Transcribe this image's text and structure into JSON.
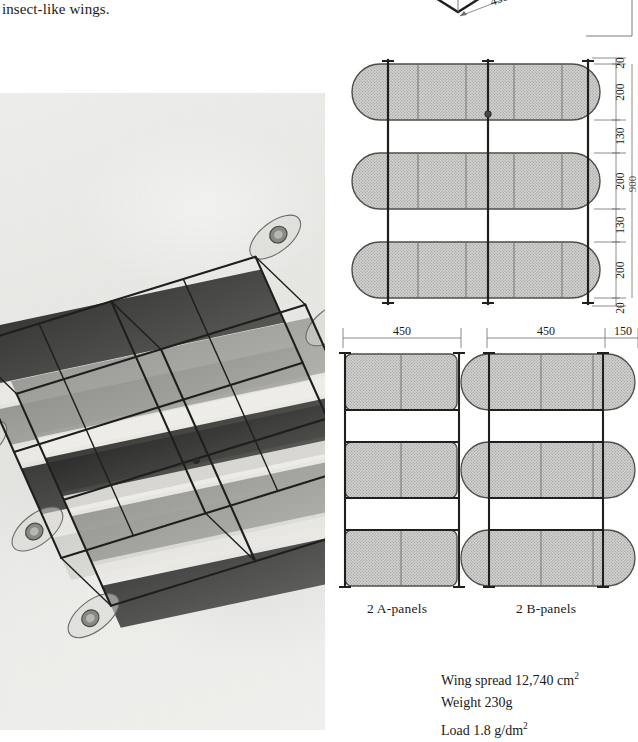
{
  "page": {
    "body_text": "insect-like wings."
  },
  "photo": {
    "alt_name": "box-kite-in-flight-photograph",
    "subject": "multi-cell box kite with insect-like wings flying against a cloudy sky",
    "tone": "black-and-white"
  },
  "top_diagram": {
    "label_left": "B",
    "label_right": "B",
    "dimension": "450"
  },
  "plan_view": {
    "name": "kite-plan-view",
    "vertical_dimensions": [
      "20",
      "200",
      "130",
      "200",
      "130",
      "200",
      "20"
    ],
    "overall_dimension": "900",
    "cell_count": 3
  },
  "panel_views": {
    "a_panel": {
      "caption": "2 A-panels",
      "dimensions": [
        "450"
      ]
    },
    "b_panel": {
      "caption": "2 B-panels",
      "dimensions": [
        "450",
        "150"
      ]
    }
  },
  "specs": {
    "wing_spread": "Wing spread 12,740 cm",
    "wing_spread_sup": "2",
    "weight": "Weight 230g",
    "load": "Load 1.8 g/dm",
    "load_sup": "2"
  },
  "colors": {
    "ink": "#1a1a1a",
    "panel_fill": "#c9c9c9",
    "paper": "#ffffff",
    "photo_sky": "#eeeeec"
  }
}
